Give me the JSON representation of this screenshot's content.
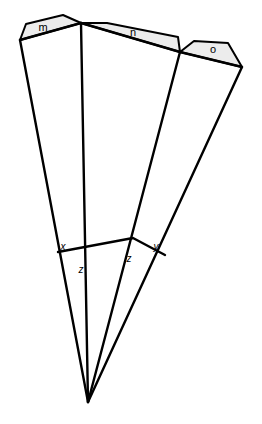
{
  "figure": {
    "background_color": "#ffffff",
    "stroke_color": "#000000",
    "shade_fill": "#ececec",
    "width": 262,
    "height": 424
  },
  "apex": {
    "name": "apex",
    "x": 88,
    "y": 402
  },
  "rays": [
    {
      "name": "ray-left",
      "x1": 88,
      "y1": 402,
      "x2": 20,
      "y2": 40
    },
    {
      "name": "ray-center-left",
      "x1": 88,
      "y1": 402,
      "x2": 81,
      "y2": 23
    },
    {
      "name": "ray-center-right",
      "x1": 88,
      "y1": 402,
      "x2": 180,
      "y2": 52
    },
    {
      "name": "ray-right",
      "x1": 88,
      "y1": 402,
      "x2": 242,
      "y2": 67
    }
  ],
  "top_edges": [
    {
      "name": "edge-m-n",
      "x1": 20,
      "y1": 40,
      "x2": 81,
      "y2": 23
    },
    {
      "name": "edge-n-o",
      "x1": 81,
      "y1": 23,
      "x2": 180,
      "y2": 52
    },
    {
      "name": "edge-o-r",
      "x1": 180,
      "y1": 52,
      "x2": 242,
      "y2": 67
    }
  ],
  "regions": [
    {
      "id": "m",
      "label": "m",
      "label_x": 43,
      "label_y": 28,
      "points": "20,40 26,24 63,15 81,23"
    },
    {
      "id": "n",
      "label": "n",
      "label_x": 133,
      "label_y": 33,
      "points": "81,23 107,23 178,37 180,52"
    },
    {
      "id": "o",
      "label": "o",
      "label_x": 213,
      "label_y": 50,
      "points": "180,52 194,41 228,43 242,67"
    }
  ],
  "transversal": {
    "name": "transversal",
    "points": "58,252 133,238 165,255"
  },
  "angles": [
    {
      "id": "x-left",
      "label": "x",
      "x": 63,
      "y": 247
    },
    {
      "id": "z-left",
      "label": "z",
      "x": 81,
      "y": 270
    },
    {
      "id": "z-right",
      "label": "z",
      "x": 129,
      "y": 259
    },
    {
      "id": "y-right",
      "label": "y",
      "x": 156,
      "y": 247
    }
  ],
  "chart_data": {
    "type": "diagram",
    "apex": [
      88,
      402
    ],
    "ray_endpoints": [
      [
        20,
        40
      ],
      [
        81,
        23
      ],
      [
        180,
        52
      ],
      [
        242,
        67
      ]
    ],
    "shaded_region_labels": [
      "m",
      "n",
      "o"
    ],
    "angle_labels": [
      "x",
      "z",
      "z",
      "y"
    ],
    "xlim": [
      0,
      262
    ],
    "ylim": [
      0,
      424
    ],
    "grid": false,
    "legend": "none"
  }
}
